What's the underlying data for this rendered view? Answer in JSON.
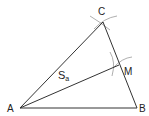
{
  "diagram": {
    "type": "triangle-median-construction",
    "points": {
      "A": {
        "label": "A",
        "x": 20,
        "y": 108
      },
      "B": {
        "label": "B",
        "x": 137,
        "y": 108
      },
      "C": {
        "label": "C",
        "x": 103,
        "y": 22
      },
      "M": {
        "label": "M",
        "x": 119,
        "y": 65
      }
    },
    "segments": [
      {
        "from": "A",
        "to": "B"
      },
      {
        "from": "B",
        "to": "C"
      },
      {
        "from": "C",
        "to": "A"
      },
      {
        "from": "A",
        "to": "M",
        "label": "S",
        "label_sub": "a"
      }
    ],
    "median_label": {
      "main": "S",
      "sub": "a"
    },
    "colors": {
      "line": "#333333",
      "arc": "#9a9a9a",
      "text": "#222222",
      "background": "#ffffff"
    }
  }
}
